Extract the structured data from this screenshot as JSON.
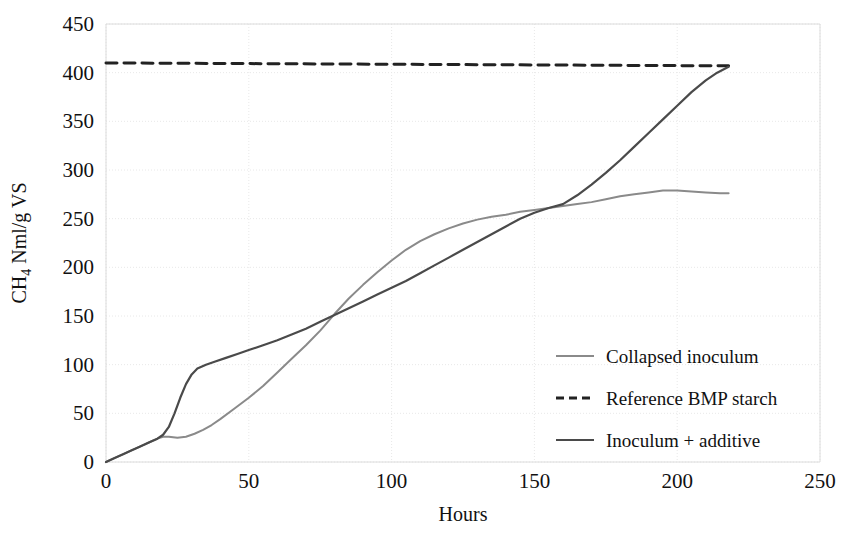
{
  "chart_data": {
    "type": "line",
    "title": "",
    "xlabel": "Hours",
    "ylabel_prefix": "CH",
    "ylabel_sub": "4",
    "ylabel_suffix": " Nml/g VS",
    "ylabel": "CH4 Nml/g VS",
    "xlim": [
      0,
      250
    ],
    "ylim": [
      0,
      450
    ],
    "xticks": [
      0,
      50,
      100,
      150,
      200,
      250
    ],
    "yticks": [
      0,
      50,
      100,
      150,
      200,
      250,
      300,
      350,
      400,
      450
    ],
    "xtick_labels": [
      "0",
      "50",
      "100",
      "150",
      "200",
      "250"
    ],
    "ytick_labels": [
      "0",
      "50",
      "100",
      "150",
      "200",
      "250",
      "300",
      "350",
      "400",
      "450"
    ],
    "grid": true,
    "grid_color": "#e8e8e8",
    "grid_style": "dotted",
    "legend_position": "center-right",
    "series": [
      {
        "name": "Collapsed inoculum",
        "style": "solid",
        "color": "#8a8a8a",
        "width": 2.0,
        "points": [
          [
            0,
            0
          ],
          [
            3,
            4
          ],
          [
            6,
            8
          ],
          [
            9,
            12
          ],
          [
            12,
            16
          ],
          [
            15,
            20
          ],
          [
            18,
            24
          ],
          [
            20,
            26
          ],
          [
            22,
            26
          ],
          [
            25,
            25
          ],
          [
            28,
            26
          ],
          [
            31,
            29
          ],
          [
            34,
            33
          ],
          [
            37,
            38
          ],
          [
            40,
            44
          ],
          [
            45,
            55
          ],
          [
            50,
            66
          ],
          [
            55,
            78
          ],
          [
            60,
            92
          ],
          [
            65,
            106
          ],
          [
            70,
            120
          ],
          [
            75,
            135
          ],
          [
            80,
            152
          ],
          [
            85,
            168
          ],
          [
            90,
            182
          ],
          [
            95,
            195
          ],
          [
            100,
            207
          ],
          [
            105,
            218
          ],
          [
            110,
            227
          ],
          [
            115,
            234
          ],
          [
            120,
            240
          ],
          [
            125,
            245
          ],
          [
            130,
            249
          ],
          [
            135,
            252
          ],
          [
            140,
            254
          ],
          [
            145,
            257
          ],
          [
            150,
            259
          ],
          [
            155,
            261
          ],
          [
            160,
            263
          ],
          [
            165,
            265
          ],
          [
            170,
            267
          ],
          [
            175,
            270
          ],
          [
            180,
            273
          ],
          [
            185,
            275
          ],
          [
            190,
            277
          ],
          [
            195,
            279
          ],
          [
            200,
            279
          ],
          [
            205,
            278
          ],
          [
            210,
            277
          ],
          [
            215,
            276
          ],
          [
            218,
            276
          ]
        ]
      },
      {
        "name": "Reference BMP starch",
        "style": "dashed",
        "color": "#222222",
        "width": 3.0,
        "points": [
          [
            0,
            410
          ],
          [
            218,
            407
          ]
        ]
      },
      {
        "name": "Inoculum + additive",
        "style": "solid",
        "color": "#4a4a4a",
        "width": 2.2,
        "points": [
          [
            0,
            0
          ],
          [
            3,
            4
          ],
          [
            6,
            8
          ],
          [
            9,
            12
          ],
          [
            12,
            16
          ],
          [
            15,
            20
          ],
          [
            18,
            24
          ],
          [
            20,
            28
          ],
          [
            22,
            36
          ],
          [
            24,
            50
          ],
          [
            26,
            66
          ],
          [
            28,
            80
          ],
          [
            30,
            90
          ],
          [
            32,
            96
          ],
          [
            35,
            100
          ],
          [
            38,
            103
          ],
          [
            42,
            107
          ],
          [
            46,
            111
          ],
          [
            50,
            115
          ],
          [
            55,
            120
          ],
          [
            60,
            125
          ],
          [
            65,
            131
          ],
          [
            70,
            137
          ],
          [
            75,
            144
          ],
          [
            80,
            151
          ],
          [
            85,
            158
          ],
          [
            90,
            165
          ],
          [
            95,
            172
          ],
          [
            100,
            179
          ],
          [
            105,
            186
          ],
          [
            110,
            194
          ],
          [
            115,
            202
          ],
          [
            120,
            210
          ],
          [
            125,
            218
          ],
          [
            130,
            226
          ],
          [
            135,
            234
          ],
          [
            140,
            242
          ],
          [
            145,
            250
          ],
          [
            150,
            256
          ],
          [
            155,
            261
          ],
          [
            160,
            265
          ],
          [
            165,
            274
          ],
          [
            170,
            285
          ],
          [
            175,
            297
          ],
          [
            180,
            310
          ],
          [
            185,
            324
          ],
          [
            190,
            338
          ],
          [
            195,
            352
          ],
          [
            200,
            366
          ],
          [
            205,
            380
          ],
          [
            210,
            392
          ],
          [
            214,
            400
          ],
          [
            218,
            406
          ]
        ]
      }
    ],
    "legend_entries": [
      {
        "label": "Collapsed inoculum",
        "style": "solid",
        "color": "#8a8a8a"
      },
      {
        "label": "Reference BMP starch",
        "style": "dashed",
        "color": "#222222"
      },
      {
        "label": "Inoculum + additive",
        "style": "solid",
        "color": "#4a4a4a"
      }
    ]
  }
}
